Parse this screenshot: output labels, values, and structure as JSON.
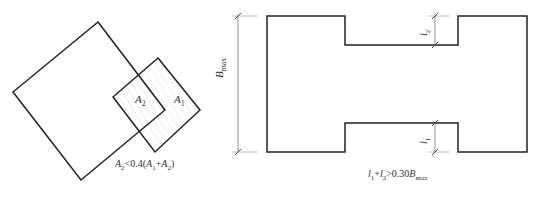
{
  "figure_left": {
    "area_inner_label": "A",
    "area_inner_sub": "2",
    "area_outer_label": "A",
    "area_outer_sub": "1",
    "condition": {
      "a": "A",
      "a_sub": "2",
      "op": "<0.4(",
      "b": "A",
      "b_sub": "1",
      "plus": "+",
      "c": "A",
      "c_sub": "2",
      "close": ")"
    }
  },
  "figure_right": {
    "dimension_label": "B",
    "dimension_sub": "max",
    "l2_label": "l",
    "l2_sub": "2",
    "l1_label": "l",
    "l1_sub": "1",
    "condition": {
      "a": "l",
      "a_sub": "1",
      "plus": "+",
      "b": "l",
      "b_sub": "2",
      "op": ">0.30",
      "c": "B",
      "c_sub": "max"
    }
  },
  "colors": {
    "line": "#222222",
    "dim": "#777777",
    "hatch": "#cccccc"
  }
}
